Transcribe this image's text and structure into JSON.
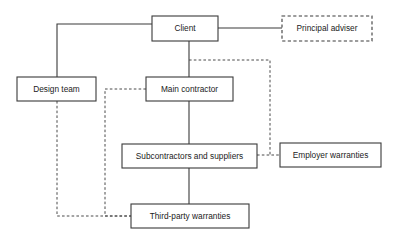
{
  "diagram": {
    "colors": {
      "background": "#ffffff",
      "box_stroke": "#3a3a3a",
      "text": "#1b1b1b",
      "edge_solid": "#3a3a3a",
      "edge_dashed": "#4a4a4a"
    },
    "nodes": [
      {
        "id": "client",
        "label": "Client",
        "border": "solid",
        "x": 152,
        "y": 16,
        "w": 66,
        "h": 25
      },
      {
        "id": "principal-adviser",
        "label": "Principal adviser",
        "border": "dashed",
        "x": 282,
        "y": 16,
        "w": 90,
        "h": 25
      },
      {
        "id": "design-team",
        "label": "Design team",
        "border": "solid",
        "x": 17,
        "y": 77,
        "w": 79,
        "h": 24
      },
      {
        "id": "main-contractor",
        "label": "Main contractor",
        "border": "solid",
        "x": 146,
        "y": 77,
        "w": 87,
        "h": 24
      },
      {
        "id": "subcontractors-and-suppliers",
        "label": "Subcontractors and suppliers",
        "border": "solid",
        "x": 122,
        "y": 144,
        "w": 135,
        "h": 24
      },
      {
        "id": "employer-warranties",
        "label": "Employer warranties",
        "border": "solid",
        "x": 280,
        "y": 143,
        "w": 101,
        "h": 24
      },
      {
        "id": "third-party-warranties",
        "label": "Third-party warranties",
        "border": "solid",
        "x": 131,
        "y": 204,
        "w": 118,
        "h": 24
      }
    ],
    "edges": [
      {
        "id": "client-to-design-team",
        "style": "solid",
        "from": "client",
        "to": "design-team",
        "path": "M 152 24 L 57 24 L 57 77"
      },
      {
        "id": "client-to-principal-adviser",
        "style": "solid",
        "from": "client",
        "to": "principal-adviser",
        "path": "M 218 28 L 282 28"
      },
      {
        "id": "client-to-main-contractor",
        "style": "solid",
        "from": "client",
        "to": "main-contractor",
        "path": "M 189 41 L 189 77"
      },
      {
        "id": "main-contractor-to-subcontractors",
        "style": "solid",
        "from": "main-contractor",
        "to": "subcontractors-and-suppliers",
        "path": "M 189 101 L 189 144"
      },
      {
        "id": "subcontractors-to-third-party-warranties",
        "style": "solid",
        "from": "subcontractors-and-suppliers",
        "to": "third-party-warranties",
        "path": "M 189 168 L 189 204"
      },
      {
        "id": "client-to-employer-warranties",
        "style": "dashed",
        "from": "client",
        "to": "employer-warranties",
        "path": "M 189 60 L 270 60 L 270 155"
      },
      {
        "id": "subcontractors-to-employer-warranties",
        "style": "dashed",
        "from": "subcontractors-and-suppliers",
        "to": "employer-warranties",
        "path": "M 257 155 L 280 155"
      },
      {
        "id": "main-contractor-to-third-party-warranties",
        "style": "dashed",
        "from": "main-contractor",
        "to": "third-party-warranties",
        "path": "M 146 89 L 105 89 L 105 216 L 131 216"
      },
      {
        "id": "design-team-to-third-party-warranties",
        "style": "dashed",
        "from": "design-team",
        "to": "third-party-warranties",
        "path": "M 57 101 L 57 216 L 131 216"
      }
    ]
  }
}
